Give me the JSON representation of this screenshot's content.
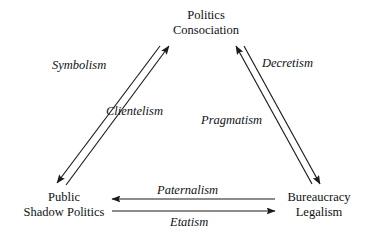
{
  "diagram": {
    "type": "triangle-relationship-diagram",
    "background_color": "#ffffff",
    "line_color": "#1a1a1a",
    "nodes": [
      {
        "id": "politics",
        "position": "top",
        "line1": "Politics",
        "line2": "Consociation"
      },
      {
        "id": "public",
        "position": "bottom-left",
        "line1": "Public",
        "line2": "Shadow Politics"
      },
      {
        "id": "bureaucracy",
        "position": "bottom-right",
        "line1": "Bureaucracy",
        "line2": "Legalism"
      }
    ],
    "edges": [
      {
        "id": "symbolism",
        "label": "Symbolism",
        "from": "politics",
        "to": "public",
        "direction": "down-left",
        "side": "left-outer"
      },
      {
        "id": "clientelism",
        "label": "Clientelism",
        "from": "public",
        "to": "politics",
        "direction": "up-right",
        "side": "left-inner"
      },
      {
        "id": "decretism",
        "label": "Decretism",
        "from": "bureaucracy",
        "to": "politics",
        "direction": "up-left",
        "side": "right-inner"
      },
      {
        "id": "pragmatism",
        "label": "Pragmatism",
        "from": "politics",
        "to": "bureaucracy",
        "direction": "down-right",
        "side": "right-outer"
      },
      {
        "id": "paternalism",
        "label": "Paternalism",
        "from": "bureaucracy",
        "to": "public",
        "direction": "left",
        "side": "bottom-upper"
      },
      {
        "id": "etatism",
        "label": "Etatism",
        "from": "public",
        "to": "bureaucracy",
        "direction": "right",
        "side": "bottom-lower"
      }
    ]
  }
}
